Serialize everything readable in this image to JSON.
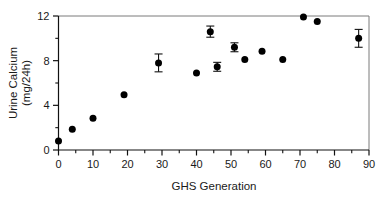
{
  "chart_data": {
    "type": "scatter",
    "title": "",
    "xlabel": "GHS Generation",
    "ylabel": "Urine Calcium\n(mg/24h)",
    "ylabel_line1": "Urine Calcium",
    "ylabel_line2": "(mg/24h)",
    "xlim": [
      0,
      90
    ],
    "ylim": [
      0,
      12
    ],
    "grid": false,
    "legend": null,
    "x_major_ticks": [
      0,
      10,
      20,
      30,
      40,
      50,
      60,
      70,
      80,
      90
    ],
    "x_minor_ticks": [
      5,
      15,
      25,
      35,
      45,
      55,
      65,
      75,
      85
    ],
    "x_tick_labels": [
      "0",
      "10",
      "20",
      "30",
      "40",
      "50",
      "60",
      "70",
      "80",
      "90"
    ],
    "y_major_ticks": [
      0,
      4,
      8,
      12
    ],
    "y_minor_ticks": [
      2,
      6,
      10
    ],
    "y_tick_labels": [
      "0",
      "4",
      "8",
      "12"
    ],
    "marker": "filled-circle",
    "marker_color": "#000000",
    "points": [
      {
        "x": 0,
        "y": 0.8,
        "err": 0
      },
      {
        "x": 4,
        "y": 1.85,
        "err": 0
      },
      {
        "x": 10,
        "y": 2.85,
        "err": 0
      },
      {
        "x": 19,
        "y": 4.95,
        "err": 0
      },
      {
        "x": 29,
        "y": 7.8,
        "err": 0.8
      },
      {
        "x": 40,
        "y": 6.9,
        "err": 0
      },
      {
        "x": 44,
        "y": 10.6,
        "err": 0.5
      },
      {
        "x": 46,
        "y": 7.45,
        "err": 0.4
      },
      {
        "x": 51,
        "y": 9.2,
        "err": 0.4
      },
      {
        "x": 54,
        "y": 8.1,
        "err": 0
      },
      {
        "x": 59,
        "y": 8.85,
        "err": 0
      },
      {
        "x": 65,
        "y": 8.1,
        "err": 0
      },
      {
        "x": 71,
        "y": 11.9,
        "err": 0
      },
      {
        "x": 75,
        "y": 11.5,
        "err": 0
      },
      {
        "x": 87,
        "y": 10.0,
        "err": 0.8
      }
    ]
  }
}
